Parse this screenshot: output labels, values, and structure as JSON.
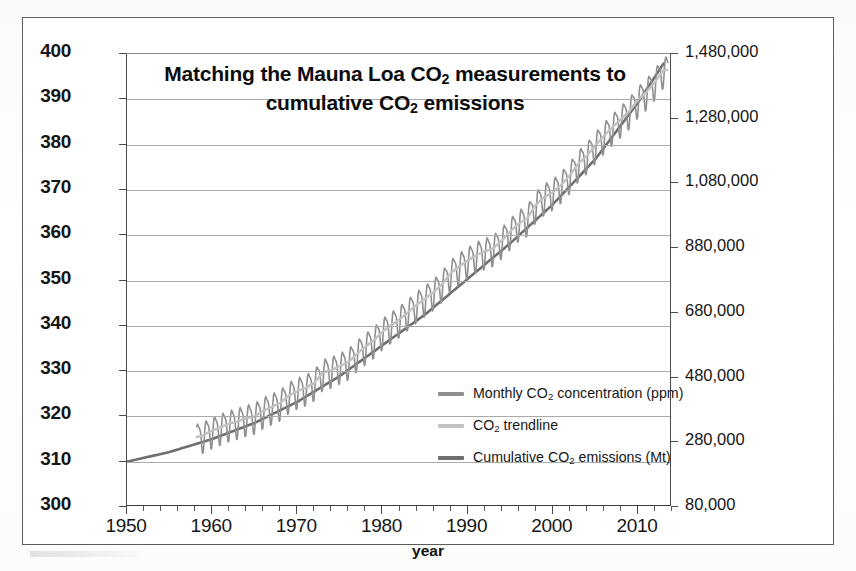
{
  "chart_data": {
    "type": "line",
    "title": "Matching the Mauna Loa CO2 measurements to cumulative CO2 emissions",
    "title_line1": "Matching the Mauna Loa CO",
    "title_line1_sub": "2",
    "title_line1_tail": " measurements to",
    "title_line2": "cumulative CO",
    "title_line2_sub": "2",
    "title_line2_tail": " emissions",
    "xlabel": "year",
    "ylabel_left": "CO2 concentration (ppmv)",
    "ylabel_left_pre": "CO",
    "ylabel_left_sub": "2",
    "ylabel_left_post": " concentration (ppmv)",
    "ylabel_right": "Cumulative CO2 Emissions since 1750 (Mega-tonnes)",
    "ylabel_right_pre": "Cumulative CO",
    "ylabel_right_sub": "2",
    "ylabel_right_post": " Emissions since 1750 (Mega-tonnes)",
    "xlim": [
      1950,
      2014
    ],
    "ylim_left": [
      300,
      400
    ],
    "ylim_right": [
      80000,
      1480000
    ],
    "ytick_left": [
      "400",
      "390",
      "380",
      "370",
      "360",
      "350",
      "340",
      "330",
      "320",
      "310",
      "300"
    ],
    "ytick_left_values": [
      400,
      390,
      380,
      370,
      360,
      350,
      340,
      330,
      320,
      310,
      300
    ],
    "ytick_right": [
      "1,480,000",
      "1,280,000",
      "1,080,000",
      "880,000",
      "680,000",
      "480,000",
      "280,000",
      "80,000"
    ],
    "ytick_right_values": [
      1480000,
      1280000,
      1080000,
      880000,
      680000,
      480000,
      280000,
      80000
    ],
    "xticks": [
      "1950",
      "1960",
      "1970",
      "1980",
      "1990",
      "2000",
      "2010"
    ],
    "xtick_values": [
      1950,
      1960,
      1970,
      1980,
      1990,
      2000,
      2010
    ],
    "xtick_minor_step": 2,
    "grid": "horizontal",
    "legend_position": "center-right-inside",
    "legend": [
      {
        "label": "Monthly CO2 concentration (ppm)",
        "label_pre": "Monthly CO",
        "label_sub": "2",
        "label_post": " concentration (ppm)",
        "color": "#8f8f8f",
        "name": "monthly-co2-concentration"
      },
      {
        "label": "CO2 trendline",
        "label_pre": "CO",
        "label_sub": "2",
        "label_post": " trendline",
        "color": "#c2c2c2",
        "name": "co2-trendline"
      },
      {
        "label": "Cumulative CO2 emissions (Mt)",
        "label_pre": "Cumulative CO",
        "label_sub": "2",
        "label_post": " emissions (Mt)",
        "color": "#6e6e6e",
        "name": "cumulative-co2-emissions"
      }
    ],
    "series": [
      {
        "name": "Monthly CO2 concentration (ppm)",
        "units": "ppmv",
        "axis": "left",
        "color": "#8f8f8f",
        "x_start": 1958.2,
        "x_end": 2013.6,
        "seasonal_amplitude_ppm": 3.2,
        "annual_points": [
          {
            "year": 1958,
            "value": 315.3
          },
          {
            "year": 1959,
            "value": 315.9
          },
          {
            "year": 1960,
            "value": 316.9
          },
          {
            "year": 1961,
            "value": 317.6
          },
          {
            "year": 1962,
            "value": 318.4
          },
          {
            "year": 1963,
            "value": 318.9
          },
          {
            "year": 1964,
            "value": 319.6
          },
          {
            "year": 1965,
            "value": 320.0
          },
          {
            "year": 1966,
            "value": 321.3
          },
          {
            "year": 1967,
            "value": 322.1
          },
          {
            "year": 1968,
            "value": 323.0
          },
          {
            "year": 1969,
            "value": 324.6
          },
          {
            "year": 1970,
            "value": 325.6
          },
          {
            "year": 1971,
            "value": 326.3
          },
          {
            "year": 1972,
            "value": 327.4
          },
          {
            "year": 1973,
            "value": 329.7
          },
          {
            "year": 1974,
            "value": 330.2
          },
          {
            "year": 1975,
            "value": 331.1
          },
          {
            "year": 1976,
            "value": 332.0
          },
          {
            "year": 1977,
            "value": 333.8
          },
          {
            "year": 1978,
            "value": 335.4
          },
          {
            "year": 1979,
            "value": 336.8
          },
          {
            "year": 1980,
            "value": 338.7
          },
          {
            "year": 1981,
            "value": 340.1
          },
          {
            "year": 1982,
            "value": 341.4
          },
          {
            "year": 1983,
            "value": 343.0
          },
          {
            "year": 1984,
            "value": 344.6
          },
          {
            "year": 1985,
            "value": 346.0
          },
          {
            "year": 1986,
            "value": 347.4
          },
          {
            "year": 1987,
            "value": 349.2
          },
          {
            "year": 1988,
            "value": 351.6
          },
          {
            "year": 1989,
            "value": 353.1
          },
          {
            "year": 1990,
            "value": 354.4
          },
          {
            "year": 1991,
            "value": 355.6
          },
          {
            "year": 1992,
            "value": 356.4
          },
          {
            "year": 1993,
            "value": 357.1
          },
          {
            "year": 1994,
            "value": 358.8
          },
          {
            "year": 1995,
            "value": 360.8
          },
          {
            "year": 1996,
            "value": 362.6
          },
          {
            "year": 1997,
            "value": 363.7
          },
          {
            "year": 1998,
            "value": 366.7
          },
          {
            "year": 1999,
            "value": 368.4
          },
          {
            "year": 2000,
            "value": 369.5
          },
          {
            "year": 2001,
            "value": 371.1
          },
          {
            "year": 2002,
            "value": 373.2
          },
          {
            "year": 2003,
            "value": 375.8
          },
          {
            "year": 2004,
            "value": 377.5
          },
          {
            "year": 2005,
            "value": 379.8
          },
          {
            "year": 2006,
            "value": 381.9
          },
          {
            "year": 2007,
            "value": 383.8
          },
          {
            "year": 2008,
            "value": 385.6
          },
          {
            "year": 2009,
            "value": 387.4
          },
          {
            "year": 2010,
            "value": 389.9
          },
          {
            "year": 2011,
            "value": 391.6
          },
          {
            "year": 2012,
            "value": 393.8
          },
          {
            "year": 2013,
            "value": 396.5
          }
        ]
      },
      {
        "name": "CO2 trendline",
        "units": "ppmv",
        "axis": "left",
        "color": "#c2c2c2"
      },
      {
        "name": "Cumulative CO2 emissions (Mt)",
        "units": "Mega-tonnes",
        "axis": "right",
        "color": "#6e6e6e",
        "x_start": 1950,
        "x_end": 2013,
        "annual_points": [
          {
            "year": 1950,
            "value": 220000
          },
          {
            "year": 1955,
            "value": 250000
          },
          {
            "year": 1960,
            "value": 290000
          },
          {
            "year": 1965,
            "value": 340000
          },
          {
            "year": 1970,
            "value": 405000
          },
          {
            "year": 1975,
            "value": 485000
          },
          {
            "year": 1980,
            "value": 580000
          },
          {
            "year": 1985,
            "value": 675000
          },
          {
            "year": 1990,
            "value": 785000
          },
          {
            "year": 1995,
            "value": 895000
          },
          {
            "year": 2000,
            "value": 1015000
          },
          {
            "year": 2005,
            "value": 1155000
          },
          {
            "year": 2010,
            "value": 1330000
          },
          {
            "year": 2013,
            "value": 1450000
          }
        ]
      }
    ]
  },
  "colors": {
    "monthly": "#8f8f8f",
    "trendline": "#c2c2c2",
    "emissions": "#6e6e6e",
    "grid": "#a9a9a9",
    "axis": "#4a4a4a",
    "text": "#161616"
  }
}
